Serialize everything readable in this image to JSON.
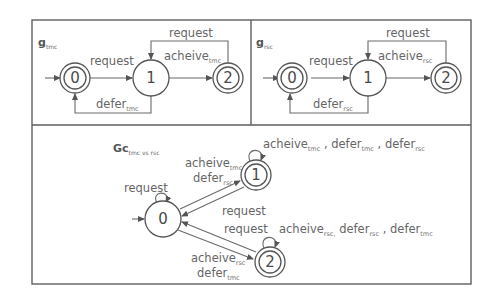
{
  "diagram": {
    "type": "finite-state-automata",
    "colors": {
      "stroke": "#5e5e5e",
      "text": "#666666",
      "background": "#ffffff"
    },
    "panels": [
      {
        "id": "tmc",
        "title": {
          "main": "g",
          "sub": "tmc"
        },
        "states": [
          {
            "id": "0",
            "label": "0",
            "initial": true,
            "accepting": true
          },
          {
            "id": "1",
            "label": "1",
            "initial": false,
            "accepting": false
          },
          {
            "id": "2",
            "label": "2",
            "initial": false,
            "accepting": true
          }
        ],
        "transitions": [
          {
            "from": "0",
            "to": "1",
            "label": "request"
          },
          {
            "from": "1",
            "to": "2",
            "label": "acheive",
            "sub": "tmc"
          },
          {
            "from": "2",
            "to": "1",
            "label": "request"
          },
          {
            "from": "1",
            "to": "0",
            "label": "defer",
            "sub": "tmc"
          }
        ]
      },
      {
        "id": "rsc",
        "title": {
          "main": "g",
          "sub": "rsc"
        },
        "states": [
          {
            "id": "0",
            "label": "0",
            "initial": true,
            "accepting": true
          },
          {
            "id": "1",
            "label": "1",
            "initial": false,
            "accepting": false
          },
          {
            "id": "2",
            "label": "2",
            "initial": false,
            "accepting": true
          }
        ],
        "transitions": [
          {
            "from": "0",
            "to": "1",
            "label": "request"
          },
          {
            "from": "1",
            "to": "2",
            "label": "acheive",
            "sub": "rsc"
          },
          {
            "from": "2",
            "to": "1",
            "label": "request"
          },
          {
            "from": "1",
            "to": "0",
            "label": "defer",
            "sub": "rsc"
          }
        ]
      },
      {
        "id": "combined",
        "title": {
          "main": "Gc",
          "sub": "tmc vs rsc"
        },
        "states": [
          {
            "id": "0",
            "label": "0",
            "initial": true,
            "accepting": false
          },
          {
            "id": "1",
            "label": "1",
            "initial": false,
            "accepting": true
          },
          {
            "id": "2",
            "label": "2",
            "initial": false,
            "accepting": true
          }
        ],
        "transitions": [
          {
            "from": "0",
            "to": "0",
            "label": "request"
          },
          {
            "from": "0",
            "to": "1",
            "label1": "acheive",
            "sub1": "tmc",
            "label2": "defer",
            "sub2": "rsc"
          },
          {
            "from": "1",
            "to": "0",
            "label": "request"
          },
          {
            "from": "1",
            "to": "1",
            "parts": [
              {
                "t": "acheive",
                "s": "tmc"
              },
              {
                "t": " , defer",
                "s": "tmc"
              },
              {
                "t": " , defer",
                "s": "rsc"
              }
            ]
          },
          {
            "from": "2",
            "to": "0",
            "label": "request"
          },
          {
            "from": "0",
            "to": "2",
            "label1": "acheive",
            "sub1": "rsc",
            "label2": "defer",
            "sub2": "tmc"
          },
          {
            "from": "2",
            "to": "2",
            "parts": [
              {
                "t": "acheive",
                "s": "rsc,"
              },
              {
                "t": " defer",
                "s": "rsc"
              },
              {
                "t": " , defer",
                "s": "tmc"
              }
            ]
          }
        ]
      }
    ]
  }
}
